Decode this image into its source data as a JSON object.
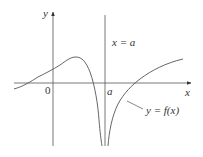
{
  "diagram": {
    "type": "function-graph-vertical-asymptote",
    "axes": {
      "x_label": "x",
      "y_label": "y",
      "origin_label": "0",
      "x_tick_label": "a"
    },
    "asymptote": {
      "label": "x = a"
    },
    "curve": {
      "label": "y = f(x)"
    },
    "colors": {
      "stroke": "#555555",
      "text": "#333333",
      "background": "#ffffff"
    }
  }
}
